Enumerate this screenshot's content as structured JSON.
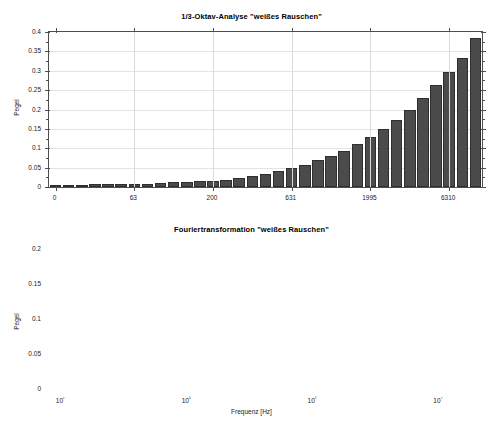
{
  "figure": {
    "background": "#ffffff",
    "bar_color": "#4b4b4b",
    "bar_edge_color": "#2e2e2e",
    "axis_color": "#4f4f4f",
    "grid_color": "#e3e3e3"
  },
  "panels": [
    {
      "title": "1/3-Oktav-Analyse \"weißes Rauschen\"",
      "ylabel": "Pegel",
      "xlabel": ""
    },
    {
      "title": "Fouriertransformation \"weißes Rauschen\"",
      "ylabel": "Pegel",
      "xlabel": "Frequenz [Hz]"
    }
  ],
  "chart_data": [
    {
      "type": "bar",
      "title": "1/3-Oktav-Analyse \"weißes Rauschen\"",
      "xlabel": "",
      "ylabel": "Pegel",
      "ylim": [
        0,
        0.4
      ],
      "ytick_labels": [
        "0",
        "0.05",
        "0.1",
        "0.15",
        "0.2",
        "0.25",
        "0.3",
        "0.35",
        "0.4"
      ],
      "ytick_values": [
        0,
        0.05,
        0.1,
        0.15,
        0.2,
        0.25,
        0.3,
        0.35,
        0.4
      ],
      "xtick_labels": [
        "0",
        "63",
        "200",
        "631",
        "1995",
        "6310",
        "19953"
      ],
      "xtick_positions": [
        0,
        6,
        12,
        18,
        24,
        30,
        36
      ],
      "grid": true,
      "legend": "none",
      "categories": [
        "25",
        "31.5",
        "40",
        "50",
        "63",
        "80",
        "100",
        "125",
        "160",
        "200",
        "250",
        "315",
        "400",
        "500",
        "631",
        "800",
        "1000",
        "1250",
        "1600",
        "1995",
        "2500",
        "3150",
        "4000",
        "5000",
        "6310",
        "8000",
        "10000",
        "12500",
        "16000",
        "19953"
      ],
      "values": [
        0.004,
        0.005,
        0.006,
        0.007,
        0.007,
        0.007,
        0.008,
        0.009,
        0.011,
        0.012,
        0.013,
        0.015,
        0.016,
        0.019,
        0.024,
        0.029,
        0.034,
        0.041,
        0.048,
        0.058,
        0.069,
        0.08,
        0.094,
        0.11,
        0.129,
        0.151,
        0.173,
        0.2,
        0.229,
        0.263,
        0.298,
        0.332,
        0.385
      ]
    },
    {
      "type": "line",
      "title": "Fouriertransformation \"weißes Rauschen\"",
      "xlabel": "Frequenz [Hz]",
      "ylabel": "Pegel",
      "xscale": "log",
      "xlim": [
        8,
        22000
      ],
      "ylim": [
        0,
        0.2
      ],
      "ytick_labels": [
        "0",
        "0.05",
        "0.1",
        "0.15",
        "0.2"
      ],
      "ytick_values": [
        0,
        0.05,
        0.1,
        0.15,
        0.2
      ],
      "xtick_labels": [
        "10¹",
        "10²",
        "10³",
        "10⁴"
      ],
      "xtick_values": [
        10,
        100,
        1000,
        10000
      ],
      "grid": true,
      "legend": "none",
      "series": [
        {
          "name": "Pegel",
          "description": "flat broadband spectrum",
          "x": [
            8,
            10,
            100,
            1000,
            10000,
            22000
          ],
          "values": [
            0.008,
            0.008,
            0.008,
            0.008,
            0.008,
            0.008
          ]
        }
      ]
    }
  ]
}
